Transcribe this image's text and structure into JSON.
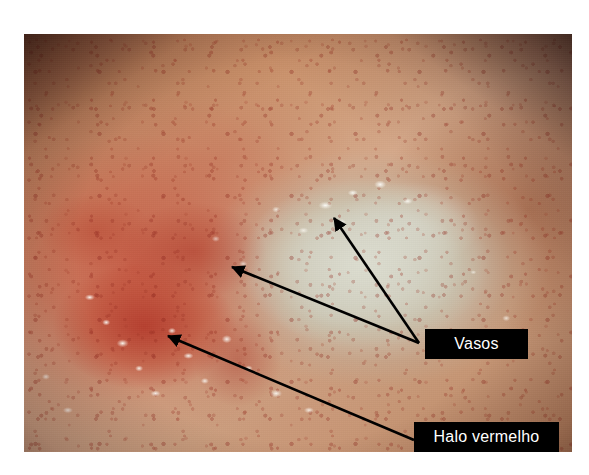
{
  "figure": {
    "kind": "annotated-endoscopic-photograph",
    "background_color": "#ffffff",
    "photo": {
      "x": 24,
      "y": 34,
      "width": 548,
      "height": 418,
      "dominant_colors": {
        "mucosa_tan": "#c98f68",
        "erythema_red": "#b6402c",
        "ulcer_base_pale": "#d6d6c6",
        "vignette_dark": "#2a0c08",
        "specular_highlight": "#fffff8"
      }
    }
  },
  "annotations": {
    "labels": [
      {
        "id": "vasos",
        "text": "Vasos",
        "box": {
          "x": 425,
          "y": 329,
          "width": 103,
          "height": 30
        },
        "text_color": "#ffffff",
        "box_color": "#000000",
        "arrow_count": 2
      },
      {
        "id": "halo",
        "text": "Halo vermelho",
        "box": {
          "x": 414,
          "y": 422,
          "width": 145,
          "height": 30
        },
        "text_color": "#ffffff",
        "box_color": "#000000",
        "arrow_count": 1
      }
    ],
    "arrows": [
      {
        "id": "arrow-vasos-upper",
        "label": "vasos",
        "from_x": 419,
        "from_y": 343,
        "to_x": 331,
        "to_y": 214,
        "color": "#000000",
        "target_description": "vessel at upper ulcer margin"
      },
      {
        "id": "arrow-vasos-lower",
        "label": "vasos",
        "from_x": 419,
        "from_y": 343,
        "to_x": 228,
        "to_y": 264,
        "color": "#000000",
        "target_description": "vessel at left ulcer margin"
      },
      {
        "id": "arrow-halo",
        "label": "halo",
        "from_x": 414,
        "from_y": 440,
        "to_x": 163,
        "to_y": 332,
        "color": "#000000",
        "target_description": "red halo surrounding the ulcer"
      }
    ]
  }
}
